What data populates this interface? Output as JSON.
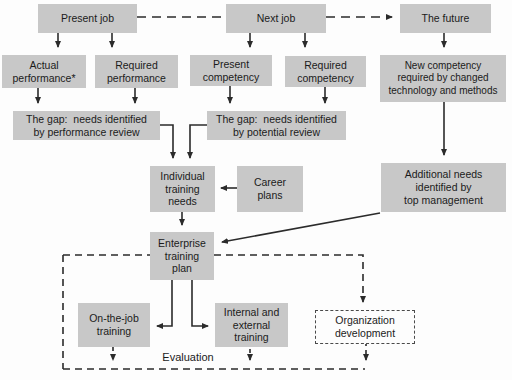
{
  "colors": {
    "background": "#fdfdfd",
    "box_fill": "#c8c8c8",
    "line": "#2b2b2b",
    "text": "#1b1b1b"
  },
  "nodes": {
    "present_job": "Present job",
    "next_job": "Next job",
    "the_future": "The future",
    "actual_performance": "Actual\nperformance*",
    "required_performance": "Required\nperformance",
    "present_competency": "Present\ncompetency",
    "required_competency": "Required\ncompetency",
    "new_competency": "New competency\nrequired by changed\ntechnology and methods",
    "gap_performance": "The gap:  needs identified\nby performance review",
    "gap_potential": "The gap:  needs identified\nby potential review",
    "individual_training_needs": "Individual\ntraining\nneeds",
    "career_plans": "Career\nplans",
    "additional_needs": "Additional needs\nidentified by\ntop management",
    "enterprise_training_plan": "Enterprise\ntraining\nplan",
    "on_the_job_training": "On-the-job\ntraining",
    "internal_external_training": "Internal and\nexternal\ntraining",
    "organization_development": "Organization\ndevelopment"
  },
  "labels": {
    "evaluation": "Evaluation"
  }
}
